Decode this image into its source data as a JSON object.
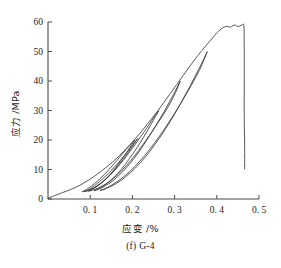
{
  "chart_data": {
    "type": "line",
    "title": "",
    "caption": "(f) G-4",
    "xlabel": "应变 /%",
    "ylabel": "应力 /MPa",
    "xlim": [
      0,
      0.5
    ],
    "ylim": [
      0,
      60
    ],
    "xticks": [
      0.1,
      0.2,
      0.3,
      0.4,
      0.5
    ],
    "xtick_labels": [
      "0. 1",
      "0. 2",
      "0. 3",
      "0. 4",
      "0. 5"
    ],
    "yticks": [
      0,
      10,
      20,
      30,
      40,
      50,
      60
    ],
    "ytick_labels": [
      "0",
      "10",
      "20",
      "30",
      "40",
      "50",
      "60"
    ],
    "grid": false,
    "legend": null,
    "series": [
      {
        "name": "backbone-loading-curve",
        "comment": "monotonic envelope: concave-up rise to plateau, then brittle vertical drop",
        "points": [
          [
            0.0,
            0.3
          ],
          [
            0.01,
            0.8
          ],
          [
            0.02,
            1.4
          ],
          [
            0.035,
            2.2
          ],
          [
            0.05,
            3.0
          ],
          [
            0.065,
            3.9
          ],
          [
            0.08,
            5.0
          ],
          [
            0.095,
            6.3
          ],
          [
            0.11,
            7.7
          ],
          [
            0.125,
            9.3
          ],
          [
            0.14,
            11.0
          ],
          [
            0.155,
            12.8
          ],
          [
            0.17,
            14.8
          ],
          [
            0.185,
            17.0
          ],
          [
            0.2,
            19.3
          ],
          [
            0.215,
            21.8
          ],
          [
            0.23,
            24.4
          ],
          [
            0.245,
            27.1
          ],
          [
            0.26,
            29.9
          ],
          [
            0.275,
            32.8
          ],
          [
            0.29,
            35.8
          ],
          [
            0.305,
            38.8
          ],
          [
            0.32,
            41.8
          ],
          [
            0.335,
            44.8
          ],
          [
            0.35,
            47.7
          ],
          [
            0.365,
            50.4
          ],
          [
            0.378,
            52.6
          ],
          [
            0.39,
            54.6
          ],
          [
            0.4,
            56.3
          ],
          [
            0.41,
            57.6
          ],
          [
            0.418,
            58.3
          ],
          [
            0.426,
            58.5
          ],
          [
            0.432,
            58.2
          ],
          [
            0.438,
            58.7
          ],
          [
            0.444,
            59.0
          ],
          [
            0.45,
            58.4
          ],
          [
            0.455,
            58.7
          ],
          [
            0.46,
            59.0
          ],
          [
            0.464,
            58.8
          ],
          [
            0.465,
            52.0
          ],
          [
            0.465,
            40.0
          ],
          [
            0.465,
            28.0
          ],
          [
            0.466,
            18.0
          ],
          [
            0.466,
            10.2
          ]
        ]
      },
      {
        "name": "cycle-1-unload-reload",
        "peak_stress": 20.0,
        "peak_strain": 0.205,
        "residual_strain": 0.082,
        "unload": [
          [
            0.205,
            19.8
          ],
          [
            0.19,
            16.6
          ],
          [
            0.175,
            13.5
          ],
          [
            0.16,
            10.6
          ],
          [
            0.145,
            8.0
          ],
          [
            0.13,
            5.9
          ],
          [
            0.115,
            4.3
          ],
          [
            0.1,
            3.2
          ],
          [
            0.09,
            2.7
          ],
          [
            0.082,
            2.5
          ]
        ],
        "reload": [
          [
            0.082,
            2.5
          ],
          [
            0.095,
            3.6
          ],
          [
            0.11,
            5.2
          ],
          [
            0.125,
            7.1
          ],
          [
            0.14,
            9.3
          ],
          [
            0.155,
            11.7
          ],
          [
            0.17,
            14.2
          ],
          [
            0.185,
            16.8
          ],
          [
            0.197,
            18.6
          ],
          [
            0.205,
            19.8
          ]
        ]
      },
      {
        "name": "cycle-2-unload-reload",
        "peak_stress": 30.0,
        "peak_strain": 0.262,
        "residual_strain": 0.097,
        "unload": [
          [
            0.262,
            29.8
          ],
          [
            0.245,
            25.5
          ],
          [
            0.228,
            21.3
          ],
          [
            0.21,
            17.2
          ],
          [
            0.192,
            13.5
          ],
          [
            0.174,
            10.1
          ],
          [
            0.156,
            7.3
          ],
          [
            0.138,
            5.2
          ],
          [
            0.12,
            3.8
          ],
          [
            0.106,
            3.0
          ],
          [
            0.097,
            2.7
          ]
        ],
        "reload": [
          [
            0.097,
            2.7
          ],
          [
            0.112,
            3.9
          ],
          [
            0.13,
            5.8
          ],
          [
            0.148,
            8.2
          ],
          [
            0.166,
            11.0
          ],
          [
            0.184,
            14.2
          ],
          [
            0.202,
            17.6
          ],
          [
            0.22,
            21.2
          ],
          [
            0.238,
            24.9
          ],
          [
            0.252,
            27.9
          ],
          [
            0.262,
            29.8
          ]
        ]
      },
      {
        "name": "cycle-3-unload-reload",
        "peak_stress": 40.0,
        "peak_strain": 0.313,
        "residual_strain": 0.11,
        "unload": [
          [
            0.313,
            39.8
          ],
          [
            0.295,
            34.8
          ],
          [
            0.276,
            29.8
          ],
          [
            0.256,
            25.0
          ],
          [
            0.236,
            20.4
          ],
          [
            0.216,
            16.1
          ],
          [
            0.196,
            12.3
          ],
          [
            0.175,
            9.0
          ],
          [
            0.155,
            6.3
          ],
          [
            0.135,
            4.4
          ],
          [
            0.12,
            3.3
          ],
          [
            0.11,
            2.9
          ]
        ],
        "reload": [
          [
            0.11,
            2.9
          ],
          [
            0.126,
            4.0
          ],
          [
            0.145,
            5.8
          ],
          [
            0.165,
            8.2
          ],
          [
            0.185,
            11.2
          ],
          [
            0.205,
            14.6
          ],
          [
            0.225,
            18.4
          ],
          [
            0.245,
            22.5
          ],
          [
            0.265,
            26.8
          ],
          [
            0.285,
            31.3
          ],
          [
            0.302,
            36.0
          ],
          [
            0.313,
            39.8
          ]
        ]
      },
      {
        "name": "cycle-4-unload-reload",
        "peak_stress": 50.0,
        "peak_strain": 0.377,
        "residual_strain": 0.124,
        "unload": [
          [
            0.377,
            49.8
          ],
          [
            0.358,
            44.2
          ],
          [
            0.338,
            38.6
          ],
          [
            0.317,
            33.1
          ],
          [
            0.296,
            27.8
          ],
          [
            0.274,
            22.8
          ],
          [
            0.252,
            18.2
          ],
          [
            0.23,
            14.1
          ],
          [
            0.207,
            10.5
          ],
          [
            0.184,
            7.5
          ],
          [
            0.162,
            5.3
          ],
          [
            0.142,
            3.8
          ],
          [
            0.13,
            3.1
          ],
          [
            0.124,
            2.9
          ]
        ],
        "reload": [
          [
            0.124,
            2.9
          ],
          [
            0.142,
            4.0
          ],
          [
            0.163,
            5.8
          ],
          [
            0.185,
            8.2
          ],
          [
            0.207,
            11.2
          ],
          [
            0.229,
            14.7
          ],
          [
            0.251,
            18.7
          ],
          [
            0.273,
            23.1
          ],
          [
            0.295,
            27.9
          ],
          [
            0.317,
            33.0
          ],
          [
            0.339,
            38.4
          ],
          [
            0.36,
            44.0
          ],
          [
            0.377,
            49.8
          ]
        ]
      },
      {
        "name": "cycle-5-partial-unload-reload",
        "peak_stress": 20.5,
        "peak_strain": 0.212,
        "residual_strain": 0.088,
        "unload": [
          [
            0.212,
            20.4
          ],
          [
            0.196,
            17.0
          ],
          [
            0.18,
            13.8
          ],
          [
            0.164,
            10.9
          ],
          [
            0.148,
            8.3
          ],
          [
            0.132,
            6.1
          ],
          [
            0.116,
            4.4
          ],
          [
            0.102,
            3.2
          ],
          [
            0.092,
            2.7
          ],
          [
            0.088,
            2.6
          ]
        ],
        "reload": [
          [
            0.088,
            2.6
          ],
          [
            0.102,
            3.7
          ],
          [
            0.118,
            5.4
          ],
          [
            0.134,
            7.4
          ],
          [
            0.15,
            9.7
          ],
          [
            0.166,
            12.2
          ],
          [
            0.182,
            14.9
          ],
          [
            0.198,
            17.8
          ],
          [
            0.212,
            20.4
          ]
        ]
      }
    ]
  }
}
